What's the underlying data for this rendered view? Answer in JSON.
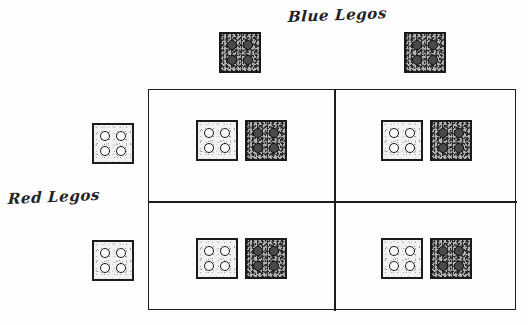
{
  "diagram": {
    "type": "punnett-square",
    "style": "hand-drawn pencil sketch",
    "background_color": "#fdfdfd",
    "ink_color": "#1d1d1d"
  },
  "labels": {
    "columns_axis": "Blue Legos",
    "rows_axis": "Red Legos"
  },
  "bricks": {
    "red": {
      "name": "Red Lego",
      "shade": "light",
      "stud_count": 4,
      "stud_layout": "2x2",
      "stud_fill": "open",
      "fill_color": "#f2f2f2",
      "outline_color": "#1b1b1b"
    },
    "blue": {
      "name": "Blue Lego",
      "shade": "dark",
      "stud_count": 4,
      "stud_layout": "2x2",
      "stud_fill": "filled",
      "fill_color": "#b4b4b4",
      "outline_color": "#1b1b1b"
    }
  },
  "column_headers": [
    {
      "brick": "blue",
      "label": "Blue Lego"
    },
    {
      "brick": "blue",
      "label": "Blue Lego"
    }
  ],
  "row_headers": [
    {
      "brick": "red",
      "label": "Red Lego"
    },
    {
      "brick": "red",
      "label": "Red Lego"
    }
  ],
  "grid": {
    "rows": 2,
    "columns": 2,
    "cells": [
      {
        "id": "cell-1-1",
        "row": 1,
        "column": 1,
        "contents": [
          "red",
          "blue"
        ]
      },
      {
        "id": "cell-1-2",
        "row": 1,
        "column": 2,
        "contents": [
          "red",
          "blue"
        ]
      },
      {
        "id": "cell-2-1",
        "row": 2,
        "column": 1,
        "contents": [
          "red",
          "blue"
        ]
      },
      {
        "id": "cell-2-2",
        "row": 2,
        "column": 2,
        "contents": [
          "red",
          "blue"
        ]
      }
    ]
  }
}
